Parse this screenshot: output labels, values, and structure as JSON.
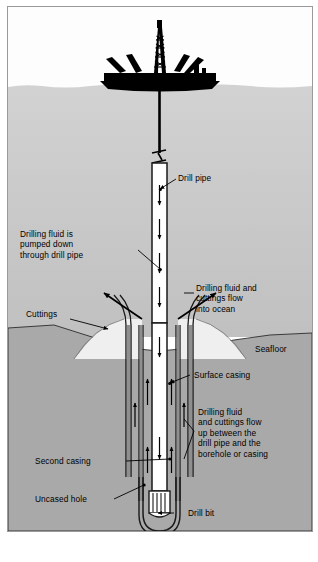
{
  "figure": {
    "background_color": "#ffffff",
    "border_color": "#9a9a9a"
  },
  "regions": {
    "sky": {
      "name": "sky",
      "color": "#fdfdfd"
    },
    "ocean": {
      "name": "ocean water",
      "color": "#c9c9c9"
    },
    "seabed": {
      "name": "seabed sediment",
      "color": "#a9a9a9"
    },
    "cuttings_mound": {
      "name": "cuttings mound",
      "color": "#efefef"
    }
  },
  "vessel": {
    "name": "drillship",
    "color": "#000000",
    "derrick": "drilling derrick tower",
    "cranes": 4
  },
  "well": {
    "drill_pipe_color": "#ffffff",
    "casing_color": "#8f8f8f",
    "outline_color": "#1a1a1a",
    "flow_down_arrows": 4,
    "flow_up_arrows": 6,
    "break_symbol": "pipe break zigzag"
  },
  "labels": {
    "drill_pipe": "Drill pipe",
    "pumped_down": "Drilling fluid is\npumped down\nthrough drill pipe",
    "into_ocean": "Drilling fluid and\ncuttings flow\ninto ocean",
    "cuttings": "Cuttings",
    "seafloor": "Seafloor",
    "surface_casing": "Surface casing",
    "up_between": "Drilling fluid\nand cuttings flow\nup between the\ndrill pipe and the\nborehole or casing",
    "second_casing": "Second casing",
    "uncased_hole": "Uncased hole",
    "drill_bit": "Drill bit"
  }
}
